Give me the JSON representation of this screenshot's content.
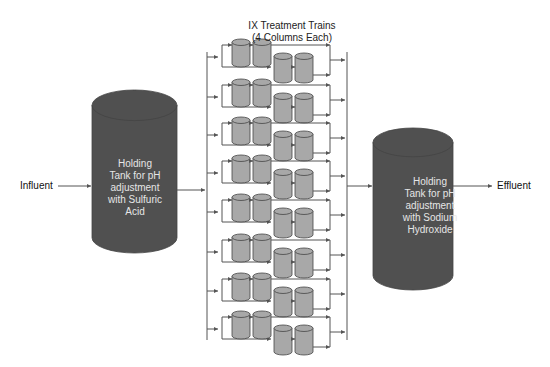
{
  "title": {
    "line1": "IX Treatment Trains",
    "line2": "(4 Columns Each)"
  },
  "influent_label": "Influent",
  "effluent_label": "Effluent",
  "tank_left": {
    "lines": [
      "Holding",
      "Tank for pH",
      "adjustment",
      "with Sulfuric",
      "Acid"
    ]
  },
  "tank_right": {
    "lines": [
      "Holding",
      "Tank for pH",
      "adjustment",
      "with Sodium",
      "Hydroxide"
    ]
  },
  "trains": {
    "count": 8,
    "columns_per_train": 4,
    "top_y": [
      45,
      85,
      123,
      161,
      200,
      240,
      279,
      317
    ]
  },
  "colors": {
    "tank_fill": "#505050",
    "column_fill": "#a8a8a8",
    "line": "#555555",
    "text": "#111111"
  }
}
